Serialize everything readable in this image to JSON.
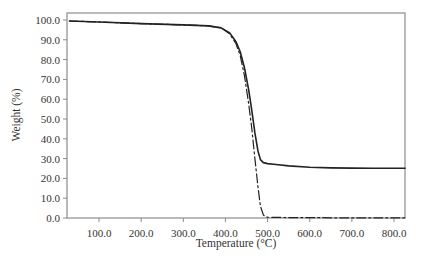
{
  "chart_data": {
    "type": "line",
    "title": "",
    "xlabel": "Temperature (°C)",
    "ylabel": "Weight (%)",
    "xlim": [
      24,
      826
    ],
    "ylim": [
      0,
      103
    ],
    "grid": false,
    "legend": null,
    "x_ticks": [
      100,
      200,
      300,
      400,
      500,
      600,
      700,
      800
    ],
    "x_tick_labels": [
      "100.0",
      "200.0",
      "300.0",
      "400.0",
      "500.0",
      "600.0",
      "700.0",
      "800.0"
    ],
    "y_ticks": [
      0,
      10,
      20,
      30,
      40,
      50,
      60,
      70,
      80,
      90,
      100
    ],
    "y_tick_labels": [
      "0.0",
      "10.0",
      "20.0",
      "30.0",
      "40.0",
      "50.0",
      "60.0",
      "70.0",
      "80.0",
      "90.0",
      "100.0"
    ],
    "series": [
      {
        "name": "solid",
        "style": "solid",
        "color": "#222222",
        "x": [
          30,
          100,
          200,
          300,
          360,
          390,
          410,
          425,
          435,
          445,
          455,
          462,
          470,
          477,
          483,
          490,
          500,
          520,
          550,
          600,
          650,
          700,
          750,
          800,
          826
        ],
        "y": [
          99.5,
          99.0,
          98.2,
          97.5,
          97.0,
          96.0,
          93.5,
          89.0,
          84.0,
          76.0,
          65.0,
          55.0,
          43.0,
          34.0,
          29.5,
          28.0,
          27.5,
          27.0,
          26.3,
          25.6,
          25.3,
          25.2,
          25.1,
          25.1,
          25.1
        ]
      },
      {
        "name": "dash-dot",
        "style": "dashdot",
        "color": "#222222",
        "x": [
          30,
          100,
          200,
          300,
          360,
          390,
          410,
          425,
          435,
          445,
          455,
          462,
          470,
          477,
          483,
          490,
          495,
          500,
          520,
          550,
          600,
          650,
          700,
          750,
          800,
          826
        ],
        "y": [
          99.5,
          99.0,
          98.2,
          97.5,
          97.0,
          96.0,
          93.0,
          88.0,
          82.0,
          72.0,
          58.0,
          46.0,
          30.0,
          16.0,
          6.0,
          1.5,
          0.6,
          0.4,
          0.3,
          0.2,
          0.2,
          0.1,
          0.1,
          0.1,
          0.1,
          0.1
        ]
      }
    ]
  },
  "labels": {
    "xlabel": "Temperature (°C)",
    "ylabel": "Weight (%)"
  },
  "colors": {
    "axis": "#888888",
    "line": "#222222",
    "text": "#333333"
  }
}
